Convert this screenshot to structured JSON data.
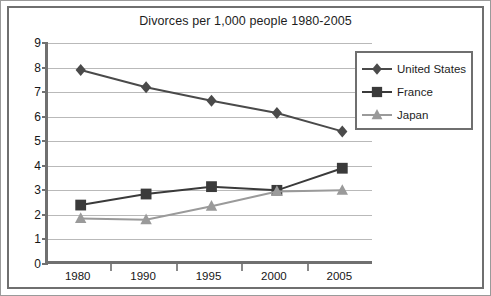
{
  "figure": {
    "border_color": "#9a9a9a",
    "frame_color": "#6f6f6f",
    "background": "#ffffff"
  },
  "legend": {
    "position": "top-right",
    "entries": [
      {
        "label": "United States",
        "marker": "diamond-marker-icon",
        "color": "#4a4a4a"
      },
      {
        "label": "France",
        "marker": "square-marker-icon",
        "color": "#3a3a3a"
      },
      {
        "label": "Japan",
        "marker": "triangle-marker-icon",
        "color": "#9a9a9a"
      }
    ]
  },
  "chart_data": {
    "type": "line",
    "title": "Divorces per 1,000 people 1980-2005",
    "xlabel": "",
    "ylabel": "",
    "categories": [
      "1980",
      "1990",
      "1995",
      "2000",
      "2005"
    ],
    "ylim": [
      0,
      9
    ],
    "ytick_step": 1,
    "yticks": [
      "9",
      "8",
      "7",
      "6",
      "5",
      "4",
      "3",
      "2",
      "1",
      "0"
    ],
    "grid": true,
    "grid_color": "#b9b9b9",
    "legend_position": "top-right",
    "series": [
      {
        "name": "United States",
        "marker": "diamond",
        "color": "#4a4a4a",
        "values": [
          7.9,
          7.2,
          6.65,
          6.15,
          5.4
        ]
      },
      {
        "name": "France",
        "marker": "square",
        "color": "#3a3a3a",
        "values": [
          2.4,
          2.85,
          3.15,
          3.0,
          3.9
        ]
      },
      {
        "name": "Japan",
        "marker": "triangle",
        "color": "#9a9a9a",
        "values": [
          1.85,
          1.8,
          2.35,
          2.95,
          3.0
        ]
      }
    ]
  }
}
